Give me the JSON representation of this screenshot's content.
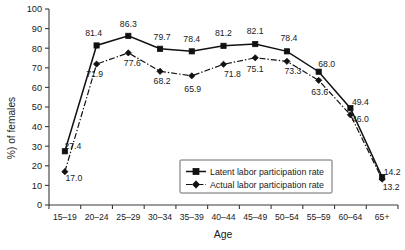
{
  "chart_data": {
    "type": "line",
    "title": "",
    "xlabel": "Age",
    "ylabel": "%) of females",
    "ylim": [
      0,
      100
    ],
    "ytick_step": 10,
    "grid": false,
    "legend_position": "inside-bottom-center",
    "categories": [
      "15–19",
      "20–24",
      "25–29",
      "30–34",
      "35–39",
      "40–44",
      "45–49",
      "50–54",
      "55–59",
      "60–64",
      "65+"
    ],
    "yticks": [
      "0",
      "10",
      "20",
      "30",
      "40",
      "50",
      "60",
      "70",
      "80",
      "90",
      "100"
    ],
    "series": [
      {
        "name": "Latent labor participation rate",
        "marker": "square",
        "line_style": "solid",
        "color": "#111111",
        "values": [
          27.4,
          81.4,
          86.3,
          79.7,
          78.4,
          81.2,
          82.1,
          78.4,
          68.0,
          49.4,
          14.2
        ],
        "labels": [
          "27.4",
          "81.4",
          "86.3",
          "79.7",
          "78.4",
          "81.2",
          "82.1",
          "78.4",
          "68.0",
          "49.4",
          "14.2"
        ]
      },
      {
        "name": "Actual labor participation rate",
        "marker": "diamond",
        "line_style": "dash-dot",
        "color": "#111111",
        "values": [
          17.0,
          71.9,
          77.6,
          68.2,
          65.9,
          71.8,
          75.1,
          73.3,
          63.6,
          46.0,
          13.2
        ],
        "labels": [
          "17.0",
          "71.9",
          "77.6",
          "68.2",
          "65.9",
          "71.8",
          "75.1",
          "73.3",
          "63.6",
          "46.0",
          "13.2"
        ]
      }
    ]
  },
  "legend": {
    "items": [
      {
        "label": "Latent labor participation rate"
      },
      {
        "label": "Actual labor participation rate"
      }
    ]
  },
  "axes": {
    "x_title": "Age",
    "y_title": "%) of females"
  }
}
